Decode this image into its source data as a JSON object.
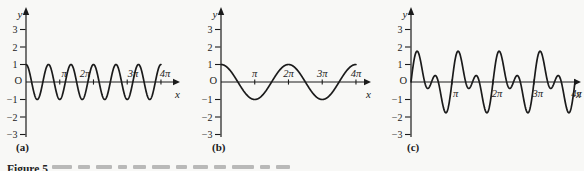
{
  "figure": {
    "caption_prefix": "Figure 5",
    "panel_captions": [
      "(a)",
      "(b)",
      "(c)"
    ]
  },
  "chart_data": [
    {
      "panel": "a",
      "type": "line",
      "title": "",
      "x_range_rad": [
        0,
        12.566
      ],
      "y_range": [
        -3,
        3
      ],
      "y_axis_label": "y",
      "x_axis_label": "x",
      "origin_label": "O",
      "y_ticks": [
        {
          "label": "3",
          "value": 3
        },
        {
          "label": "2",
          "value": 2
        },
        {
          "label": "1",
          "value": 1
        },
        {
          "label": "−1",
          "value": -1
        },
        {
          "label": "−2",
          "value": -2
        },
        {
          "label": "−3",
          "value": -3
        }
      ],
      "x_ticks_pi": [
        1,
        2,
        3,
        4
      ],
      "x_tick_labels": [
        {
          "label": "π",
          "pos_pi": 1.13
        },
        {
          "label": "2π",
          "pos_pi": 1.75
        },
        {
          "label": "3π",
          "pos_pi": 3.17
        },
        {
          "label": "4π",
          "pos_pi": 4.12
        }
      ],
      "x_label_side": "above",
      "series": [
        {
          "name": "high-frequency wave",
          "terms": [
            {
              "amp": 1,
              "freq": 3,
              "fn": "cos"
            }
          ]
        }
      ],
      "amplitude": 1,
      "peaks_between_0_and_4pi": 7
    },
    {
      "panel": "b",
      "type": "line",
      "title": "",
      "x_range_rad": [
        0,
        12.566
      ],
      "y_range": [
        -3,
        3
      ],
      "y_axis_label": "y",
      "x_axis_label": "x",
      "origin_label": "O",
      "y_ticks": [
        {
          "label": "3",
          "value": 3
        },
        {
          "label": "2",
          "value": 2
        },
        {
          "label": "1",
          "value": 1
        },
        {
          "label": "−1",
          "value": -1
        },
        {
          "label": "−2",
          "value": -2
        },
        {
          "label": "−3",
          "value": -3
        }
      ],
      "x_ticks_pi": [
        1,
        2,
        3,
        4
      ],
      "x_tick_labels": [
        {
          "label": "π",
          "pos_pi": 1.0
        },
        {
          "label": "2π",
          "pos_pi": 2.0
        },
        {
          "label": "3π",
          "pos_pi": 3.0
        },
        {
          "label": "4π",
          "pos_pi": 4.0
        }
      ],
      "x_label_side": "above",
      "series": [
        {
          "name": "low-frequency wave",
          "terms": [
            {
              "amp": 1,
              "freq": 1,
              "fn": "cos"
            }
          ]
        }
      ],
      "amplitude": 1,
      "peaks_between_0_and_4pi": 3
    },
    {
      "panel": "c",
      "type": "line",
      "title": "",
      "x_range_rad": [
        0,
        12.566
      ],
      "y_range": [
        -3,
        3
      ],
      "y_axis_label": "y",
      "x_axis_label": "x",
      "origin_label": "O",
      "y_ticks": [
        {
          "label": "3",
          "value": 3
        },
        {
          "label": "2",
          "value": 2
        },
        {
          "label": "1",
          "value": 1
        },
        {
          "label": "−1",
          "value": -1
        },
        {
          "label": "−2",
          "value": -2
        },
        {
          "label": "−3",
          "value": -3
        }
      ],
      "x_ticks_pi": [
        1,
        2,
        3,
        4
      ],
      "x_tick_labels": [
        {
          "label": "π",
          "pos_pi": 1.09
        },
        {
          "label": "2π",
          "pos_pi": 2.1
        },
        {
          "label": "3π",
          "pos_pi": 3.09
        },
        {
          "label": "4π",
          "pos_pi": 4.04
        }
      ],
      "x_label_side": "below",
      "series": [
        {
          "name": "combined wave",
          "terms": [
            {
              "amp": 1,
              "freq": 2,
              "fn": "sin"
            },
            {
              "amp": 1,
              "freq": 4,
              "fn": "sin"
            }
          ]
        }
      ],
      "max_value": 1.76,
      "min_value": -1.76
    }
  ]
}
